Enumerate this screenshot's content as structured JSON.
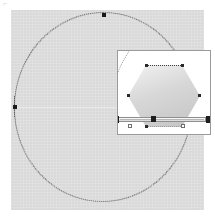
{
  "document": {
    "title": "Geometric selection canvas",
    "corner_mark": "⌐"
  },
  "canvas": {
    "background_color": "#d9d9d9",
    "border_color": "#c9c9c9",
    "width": 193,
    "height": 200
  },
  "selection": {
    "shape_name": "circle",
    "stroke_style": "dotted",
    "stroke_color": "#6e6e6e",
    "handles": [
      {
        "name": "handle-top",
        "x": 91,
        "y": 3
      },
      {
        "name": "handle-left",
        "x": 2,
        "y": 95
      }
    ]
  },
  "inset_panel": {
    "background_color": "#ffffff",
    "border_color": "#9a9a9a",
    "x": 106,
    "y": 40,
    "width": 94,
    "height": 85,
    "hexagon": {
      "shape_name": "hexagon",
      "fill_start": "#f2f2f2",
      "fill_end": "#c4c4c4",
      "edge_style": "dotted",
      "vertex_count": 6,
      "vertices": [
        {
          "name": "vertex-top-left"
        },
        {
          "name": "vertex-top-right"
        },
        {
          "name": "vertex-right"
        },
        {
          "name": "vertex-bottom-right"
        },
        {
          "name": "vertex-bottom-left"
        },
        {
          "name": "vertex-left"
        }
      ]
    },
    "slider": {
      "name": "horizontal-bar-widget",
      "track_color": "#d6d6d6",
      "cap_color": "#1d1d1d",
      "handles": [
        {
          "name": "cap-left"
        },
        {
          "name": "mid-handle"
        },
        {
          "name": "cap-right"
        }
      ],
      "markers": [
        {
          "name": "square-marker-left"
        },
        {
          "name": "square-marker-right"
        }
      ]
    }
  }
}
